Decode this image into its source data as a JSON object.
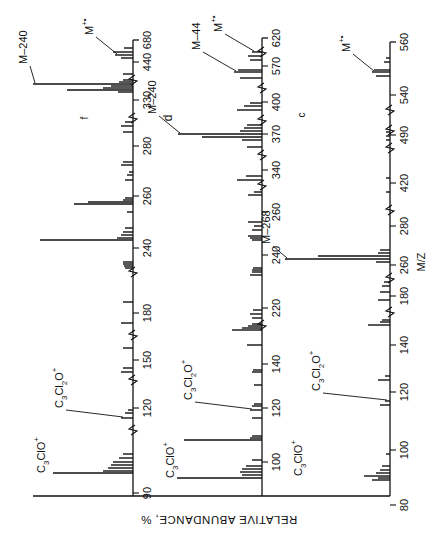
{
  "chart_data": [
    {
      "type": "bar",
      "panel": "f",
      "orientation": "rotated-90ccw",
      "xlabel": "M/Z",
      "ylabel": "RELATIVE ABUNDANCE, %",
      "baseline_x": 133,
      "ticks": [
        {
          "label": "90",
          "y": 493
        },
        {
          "label": "120",
          "y": 408
        },
        {
          "label": "150",
          "y": 360
        },
        {
          "label": "180",
          "y": 313
        },
        {
          "label": "240",
          "y": 248
        },
        {
          "label": "260",
          "y": 196
        },
        {
          "label": "280",
          "y": 146
        },
        {
          "label": "330",
          "y": 100
        },
        {
          "label": "440",
          "y": 62
        },
        {
          "label": "680",
          "y": 40
        }
      ],
      "breaks_y": [
        430,
        380,
        335,
        272,
        118,
        80
      ],
      "peaks": [
        {
          "y": 473,
          "h": 80
        },
        {
          "y": 471,
          "h": 30
        },
        {
          "y": 468,
          "h": 25
        },
        {
          "y": 465,
          "h": 22
        },
        {
          "y": 462,
          "h": 20
        },
        {
          "y": 458,
          "h": 14
        },
        {
          "y": 454,
          "h": 10
        },
        {
          "y": 418,
          "h": 12
        },
        {
          "y": 413,
          "h": 8
        },
        {
          "y": 410,
          "h": 5
        },
        {
          "y": 372,
          "h": 12
        },
        {
          "y": 368,
          "h": 10
        },
        {
          "y": 348,
          "h": 10
        },
        {
          "y": 323,
          "h": 12
        },
        {
          "y": 302,
          "h": 10
        },
        {
          "y": 268,
          "h": 8
        },
        {
          "y": 266,
          "h": 9
        },
        {
          "y": 264,
          "h": 10
        },
        {
          "y": 262,
          "h": 10
        },
        {
          "y": 240,
          "h": 93
        },
        {
          "y": 238,
          "h": 16
        },
        {
          "y": 235,
          "h": 12
        },
        {
          "y": 232,
          "h": 10
        },
        {
          "y": 228,
          "h": 8
        },
        {
          "y": 212,
          "h": 6
        },
        {
          "y": 204,
          "h": 59
        },
        {
          "y": 202,
          "h": 45
        },
        {
          "y": 200,
          "h": 10
        },
        {
          "y": 198,
          "h": 8
        },
        {
          "y": 180,
          "h": 8
        },
        {
          "y": 175,
          "h": 6
        },
        {
          "y": 172,
          "h": 4
        },
        {
          "y": 165,
          "h": 12
        },
        {
          "y": 162,
          "h": 10
        },
        {
          "y": 132,
          "h": 10
        },
        {
          "y": 126,
          "h": 12
        },
        {
          "y": 122,
          "h": 8
        },
        {
          "y": 92,
          "h": 15
        },
        {
          "y": 90,
          "h": 66
        },
        {
          "y": 88,
          "h": 30
        },
        {
          "y": 86,
          "h": 22
        },
        {
          "y": 84,
          "h": 100
        },
        {
          "y": 82,
          "h": 14
        },
        {
          "y": 80,
          "h": 10
        },
        {
          "y": 74,
          "h": 10
        },
        {
          "y": 58,
          "h": 12
        },
        {
          "y": 55,
          "h": 18
        },
        {
          "y": 52,
          "h": 20
        },
        {
          "y": 48,
          "h": 9
        }
      ],
      "annotations": [
        {
          "text": "C3ClO+",
          "peak_y": 473
        },
        {
          "text": "C3Cl2O+",
          "peak_y": 430
        },
        {
          "text": "M-240",
          "peak_y": 84
        },
        {
          "text": "M+•",
          "peak_y": 55
        }
      ]
    },
    {
      "type": "bar",
      "panel": "d",
      "orientation": "rotated-90ccw",
      "xlabel": "M/Z",
      "ylabel": "RELATIVE ABUNDANCE, %",
      "baseline_x": 262,
      "ticks": [
        {
          "label": "100",
          "y": 462
        },
        {
          "label": "120",
          "y": 408
        },
        {
          "label": "140",
          "y": 364
        },
        {
          "label": "220",
          "y": 308
        },
        {
          "label": "240",
          "y": 255
        },
        {
          "label": "260",
          "y": 212
        },
        {
          "label": "340",
          "y": 170
        },
        {
          "label": "370",
          "y": 134
        },
        {
          "label": "400",
          "y": 102
        },
        {
          "label": "570",
          "y": 66
        },
        {
          "label": "620",
          "y": 38
        }
      ],
      "breaks_y": [
        325,
        185,
        155,
        120,
        88,
        52
      ],
      "peaks": [
        {
          "y": 478,
          "h": 85
        },
        {
          "y": 475,
          "h": 20
        },
        {
          "y": 472,
          "h": 22
        },
        {
          "y": 469,
          "h": 20
        },
        {
          "y": 466,
          "h": 16
        },
        {
          "y": 460,
          "h": 10
        },
        {
          "y": 440,
          "h": 78
        },
        {
          "y": 438,
          "h": 12
        },
        {
          "y": 436,
          "h": 10
        },
        {
          "y": 418,
          "h": 10
        },
        {
          "y": 410,
          "h": 12
        },
        {
          "y": 406,
          "h": 10
        },
        {
          "y": 404,
          "h": 8
        },
        {
          "y": 385,
          "h": 8
        },
        {
          "y": 372,
          "h": 10
        },
        {
          "y": 370,
          "h": 9
        },
        {
          "y": 345,
          "h": 15
        },
        {
          "y": 330,
          "h": 30
        },
        {
          "y": 328,
          "h": 20
        },
        {
          "y": 326,
          "h": 14
        },
        {
          "y": 324,
          "h": 10
        },
        {
          "y": 318,
          "h": 10
        },
        {
          "y": 314,
          "h": 12
        },
        {
          "y": 310,
          "h": 9
        },
        {
          "y": 275,
          "h": 12
        },
        {
          "y": 272,
          "h": 10
        },
        {
          "y": 270,
          "h": 10
        },
        {
          "y": 268,
          "h": 9
        },
        {
          "y": 240,
          "h": 10
        },
        {
          "y": 238,
          "h": 12
        },
        {
          "y": 236,
          "h": 14
        },
        {
          "y": 230,
          "h": 10
        },
        {
          "y": 226,
          "h": 8
        },
        {
          "y": 222,
          "h": 14
        },
        {
          "y": 195,
          "h": 14
        },
        {
          "y": 192,
          "h": 8
        },
        {
          "y": 180,
          "h": 25
        },
        {
          "y": 176,
          "h": 16
        },
        {
          "y": 147,
          "h": 15
        },
        {
          "y": 140,
          "h": 20
        },
        {
          "y": 137,
          "h": 60
        },
        {
          "y": 134,
          "h": 84
        },
        {
          "y": 131,
          "h": 22
        },
        {
          "y": 128,
          "h": 18
        },
        {
          "y": 125,
          "h": 15
        },
        {
          "y": 110,
          "h": 25
        },
        {
          "y": 106,
          "h": 18
        },
        {
          "y": 103,
          "h": 12
        },
        {
          "y": 78,
          "h": 22
        },
        {
          "y": 72,
          "h": 28
        },
        {
          "y": 70,
          "h": 24
        },
        {
          "y": 60,
          "h": 12
        },
        {
          "y": 56,
          "h": 14
        },
        {
          "y": 52,
          "h": 10
        }
      ],
      "annotations": [
        {
          "text": "C3ClO+",
          "peak_y": 478
        },
        {
          "text": "C3Cl2O+",
          "peak_y": 410
        },
        {
          "text": "M-240",
          "peak_y": 134
        },
        {
          "text": "M-44",
          "peak_y": 72
        },
        {
          "text": "M+•",
          "peak_y": 52
        }
      ]
    },
    {
      "type": "bar",
      "panel": "c",
      "orientation": "rotated-90ccw",
      "xlabel": "M/Z",
      "ylabel": "RELATIVE ABUNDANCE, %",
      "baseline_x": 390,
      "ticks": [
        {
          "label": "80",
          "y": 505
        },
        {
          "label": "100",
          "y": 450
        },
        {
          "label": "120",
          "y": 392
        },
        {
          "label": "140",
          "y": 345
        },
        {
          "label": "180",
          "y": 296
        },
        {
          "label": "260",
          "y": 265
        },
        {
          "label": "280",
          "y": 226
        },
        {
          "label": "420",
          "y": 183
        },
        {
          "label": "490",
          "y": 135
        },
        {
          "label": "540",
          "y": 95
        },
        {
          "label": "560",
          "y": 42
        }
      ],
      "breaks_y": [
        312,
        278,
        210,
        148,
        130,
        110
      ],
      "peaks": [
        {
          "y": 480,
          "h": 18
        },
        {
          "y": 478,
          "h": 12
        },
        {
          "y": 476,
          "h": 26
        },
        {
          "y": 473,
          "h": 14
        },
        {
          "y": 470,
          "h": 10
        },
        {
          "y": 466,
          "h": 8
        },
        {
          "y": 454,
          "h": 4
        },
        {
          "y": 405,
          "h": 10
        },
        {
          "y": 401,
          "h": 5
        },
        {
          "y": 380,
          "h": 12
        },
        {
          "y": 376,
          "h": 5
        },
        {
          "y": 325,
          "h": 22
        },
        {
          "y": 322,
          "h": 10
        },
        {
          "y": 320,
          "h": 8
        },
        {
          "y": 300,
          "h": 12
        },
        {
          "y": 292,
          "h": 10
        },
        {
          "y": 286,
          "h": 8
        },
        {
          "y": 282,
          "h": 6
        },
        {
          "y": 262,
          "h": 14
        },
        {
          "y": 259,
          "h": 105
        },
        {
          "y": 256,
          "h": 72
        },
        {
          "y": 253,
          "h": 12
        },
        {
          "y": 250,
          "h": 10
        },
        {
          "y": 192,
          "h": 4
        },
        {
          "y": 178,
          "h": 4
        },
        {
          "y": 140,
          "h": 4
        },
        {
          "y": 136,
          "h": 4
        },
        {
          "y": 132,
          "h": 4
        },
        {
          "y": 76,
          "h": 14
        },
        {
          "y": 72,
          "h": 18
        },
        {
          "y": 70,
          "h": 16
        },
        {
          "y": 62,
          "h": 6
        },
        {
          "y": 58,
          "h": 4
        }
      ],
      "annotations": [
        {
          "text": "C3ClO+",
          "peak_y": 476
        },
        {
          "text": "C3Cl2O+",
          "peak_y": 392
        },
        {
          "text": "M-268",
          "peak_y": 259
        },
        {
          "text": "M+•",
          "peak_y": 72
        }
      ]
    }
  ],
  "labels": {
    "panel_f": "f",
    "panel_d": "d",
    "panel_c": "c",
    "x_axis_title": "M/Z",
    "y_axis_title": "RELATIVE ABUNDANCE, %"
  },
  "colors": {
    "ink": "#111111",
    "background": "#ffffff"
  }
}
